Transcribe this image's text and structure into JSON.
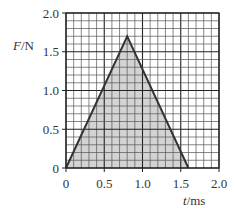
{
  "chart_data": {
    "type": "area",
    "title": "",
    "xlabel": "t / ms",
    "ylabel": "F / N",
    "xlabel_var": "t",
    "xlabel_unit": "ms",
    "ylabel_var": "F",
    "ylabel_unit": "N",
    "xlim": [
      0,
      2.0
    ],
    "ylim": [
      0,
      2.0
    ],
    "x_ticks": [
      "0",
      "0.5",
      "1.0",
      "1.5",
      "2.0"
    ],
    "y_ticks": [
      "0",
      "0.5",
      "1.0",
      "1.5",
      "2.0"
    ],
    "grid": {
      "on": true,
      "minor_step": 0.1,
      "major_step": 0.5
    },
    "series": [
      {
        "name": "force-time pulse",
        "shape": "triangle",
        "x": [
          0,
          0.8,
          1.6
        ],
        "y": [
          0,
          1.7,
          0
        ],
        "fill_color": "#d3d3d3",
        "line_color": "#333333"
      }
    ],
    "legend": null
  },
  "colors": {
    "grid_minor": "#555555",
    "grid_major": "#222222",
    "fill": "#d3d3d3",
    "line": "#333333",
    "text": "#333333"
  }
}
